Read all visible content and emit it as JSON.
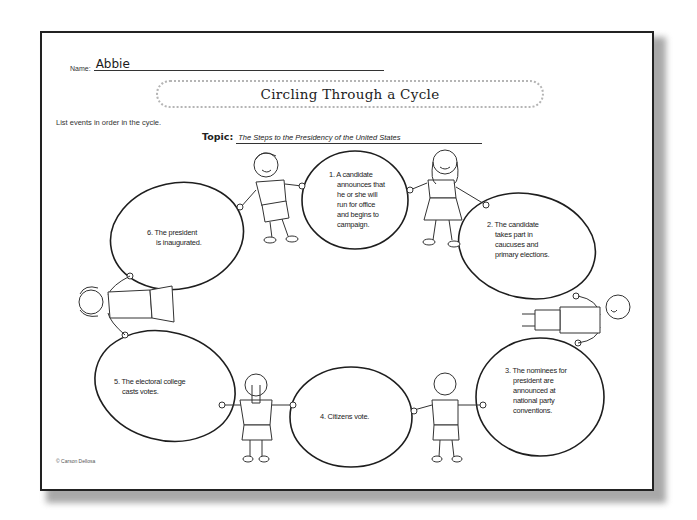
{
  "worksheet": {
    "name_label": "Name:",
    "name_value": "Abbie",
    "title": "Circling Through a Cycle",
    "instructions": "List events in order in the cycle.",
    "topic_label": "Topic:",
    "topic_value": "The Steps to the Presidency of the United States",
    "copyright": "© Carson Dellosa"
  },
  "cycle": {
    "steps": [
      {
        "number": "1.",
        "text_lines": [
          "1. A candidate",
          "announces that",
          "he or she will",
          "run for office",
          "and begins to",
          "campaign."
        ]
      },
      {
        "number": "2.",
        "text_lines": [
          "2. The candidate",
          "takes part in",
          "caucuses and",
          "primary elections."
        ]
      },
      {
        "number": "3.",
        "text_lines": [
          "3. The nominees for",
          "president are",
          "announced at",
          "national party",
          "conventions."
        ]
      },
      {
        "number": "4.",
        "text_lines": [
          "4. Citizens vote."
        ]
      },
      {
        "number": "5.",
        "text_lines": [
          "5. The electoral college",
          "casts votes."
        ]
      },
      {
        "number": "6.",
        "text_lines": [
          "6. The president",
          "is inaugurated."
        ]
      }
    ]
  },
  "illustrations": {
    "figures": [
      "boy-top-left",
      "girl-top-right",
      "boy-right",
      "boy-bottom-right",
      "girl-bottom-left",
      "girl-left"
    ]
  }
}
